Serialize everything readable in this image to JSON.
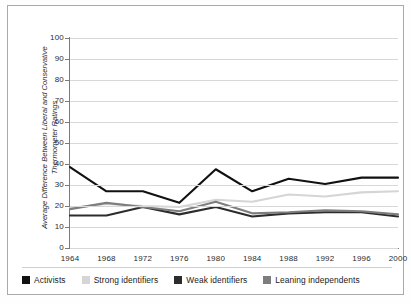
{
  "chart_data": {
    "type": "line",
    "title": "",
    "xlabel": "",
    "ylabel": "Average Difference Between Liberal and Conservative Thermometer Ratings",
    "categories": [
      "1964",
      "1968",
      "1972",
      "1976",
      "1980",
      "1984",
      "1988",
      "1992",
      "1996",
      "2000"
    ],
    "x": [
      1964,
      1968,
      1972,
      1976,
      1980,
      1984,
      1988,
      1992,
      1996,
      2000
    ],
    "ylim": [
      0,
      100
    ],
    "yticks": [
      0,
      10,
      20,
      30,
      40,
      50,
      60,
      70,
      80,
      90,
      100
    ],
    "ytick_labels": [
      "0",
      "10",
      "20",
      "30",
      "40",
      "50",
      "60",
      "70",
      "80",
      "90",
      "100"
    ],
    "grid": true,
    "legend_position": "bottom",
    "series": [
      {
        "name": "Activists",
        "color": "#111111",
        "values": [
          38.5,
          27.0,
          27.0,
          21.5,
          37.5,
          27.0,
          33.0,
          30.5,
          33.5,
          33.5
        ]
      },
      {
        "name": "Strong identifiers",
        "color": "#d5d5d5",
        "values": [
          19.0,
          21.0,
          20.0,
          19.5,
          23.0,
          22.0,
          25.5,
          24.5,
          26.5,
          27.0
        ]
      },
      {
        "name": "Weak identifiers",
        "color": "#2c2c2c",
        "values": [
          15.5,
          15.5,
          19.5,
          16.0,
          19.5,
          15.0,
          16.5,
          17.0,
          17.0,
          15.0
        ]
      },
      {
        "name": "Leaning independents",
        "color": "#7d7d7d",
        "values": [
          18.5,
          21.5,
          19.5,
          17.5,
          22.0,
          16.5,
          17.0,
          18.0,
          17.5,
          16.0
        ]
      }
    ]
  },
  "axis": {
    "y_title": "Average Difference Between Liberal and Conservative Thermometer Ratings"
  },
  "colors": {
    "gridline": "#d8d8d8",
    "axis": "#7a7a7a",
    "frame": "#a9a9a9",
    "text": "#2b2b2b",
    "background": "#ffffff"
  }
}
